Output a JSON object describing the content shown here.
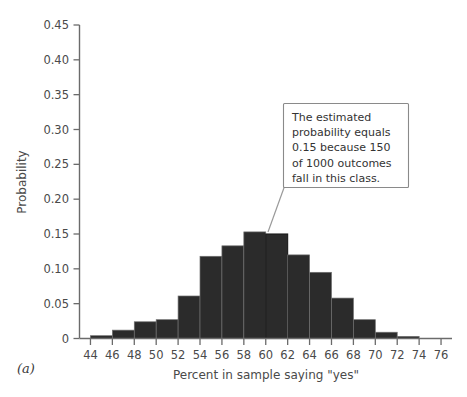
{
  "figure": {
    "panel_label": "(a)",
    "annotation": {
      "name": "callout-annotation",
      "lines": [
        "The estimated",
        "probability equals",
        "0.15 because 150",
        "of 1000 outcomes",
        "fall in this class."
      ],
      "full_text": "The estimated probability equals 0.15 because 150 of 1000 outcomes fall in this class.",
      "points_to_bin": "60-62"
    },
    "colors": {
      "bar_fill": "#2b2b2b",
      "bar_stroke": "#6e6e6e",
      "axis": "#6b6b6b",
      "text": "#4a4a4a",
      "callout_border": "#8a8a8a",
      "background": "#ffffff"
    }
  },
  "chart_data": {
    "type": "bar",
    "title": "",
    "subtitle": "",
    "xlabel": "Percent in sample saying \"yes\"",
    "ylabel": "Probability",
    "xlim": [
      43,
      77
    ],
    "ylim": [
      0,
      0.45
    ],
    "grid": false,
    "legend": null,
    "bin_width": 2,
    "x_tick_labels": [
      "44",
      "46",
      "48",
      "50",
      "52",
      "54",
      "56",
      "58",
      "60",
      "62",
      "64",
      "66",
      "68",
      "70",
      "72",
      "74",
      "76"
    ],
    "x_ticks": [
      44,
      46,
      48,
      50,
      52,
      54,
      56,
      58,
      60,
      62,
      64,
      66,
      68,
      70,
      72,
      74,
      76
    ],
    "y_tick_labels": [
      "0",
      "0.05",
      "0.10",
      "0.15",
      "0.20",
      "0.25",
      "0.30",
      "0.35",
      "0.40",
      "0.45"
    ],
    "y_ticks": [
      0,
      0.05,
      0.1,
      0.15,
      0.2,
      0.25,
      0.3,
      0.35,
      0.4,
      0.45
    ],
    "categories": [
      "44-46",
      "46-48",
      "48-50",
      "50-52",
      "52-54",
      "54-56",
      "56-58",
      "58-60",
      "60-62",
      "62-64",
      "64-66",
      "66-68",
      "68-70",
      "70-72",
      "72-74"
    ],
    "bin_starts": [
      44,
      46,
      48,
      50,
      52,
      54,
      56,
      58,
      60,
      62,
      64,
      66,
      68,
      70,
      72
    ],
    "values": [
      0.004,
      0.012,
      0.024,
      0.027,
      0.061,
      0.118,
      0.133,
      0.153,
      0.15,
      0.12,
      0.095,
      0.058,
      0.027,
      0.009,
      0.003
    ],
    "highlighted_bin": "60-62",
    "highlighted_value": 0.15,
    "highlight_style": "diagonal-hatch",
    "annotations": [
      {
        "target_bin": "60-62",
        "text": "The estimated probability equals 0.15 because 150 of 1000 outcomes fall in this class."
      }
    ]
  }
}
